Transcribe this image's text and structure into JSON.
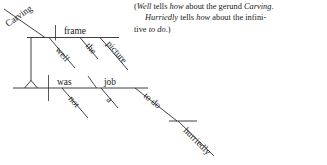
{
  "figure": {
    "kind": "reed-kellogg-sentence-diagram",
    "sentence": "Carving the picture frame well was not a job to do hurriedly.",
    "words": {
      "gerund_subject": "Carving",
      "gerund_object": "frame",
      "gerund_adverb": "well",
      "article_frame": "the",
      "noun_modifier": "picture",
      "verb": "was",
      "verb_adverb": "not",
      "predicate_nominative": "job",
      "article_job": "a",
      "infinitive": "to do",
      "infinitive_adverb": "hurriedly"
    }
  },
  "gloss": {
    "line1_open_paren": "(",
    "line1_word": "Well",
    "line1_a": " tells ",
    "line1_how": "how",
    "line1_b": " about the gerund ",
    "line1_gerund": "Carving",
    "line1_c": ".",
    "line2_word": "Hurriedly",
    "line2_a": " tells ",
    "line2_how": "how",
    "line2_b": " about the infini-",
    "line3_a": "tive ",
    "line3_inf": "to do",
    "line3_close": ".)"
  },
  "colors": {
    "ink": "#1a1a1a",
    "rule": "#2b2b2b",
    "background": "#ffffff"
  }
}
